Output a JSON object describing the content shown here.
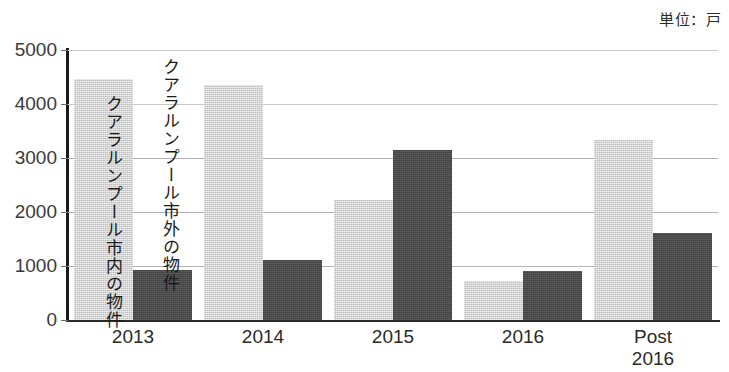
{
  "unit_caption": "単位：戸",
  "annotations": [
    {
      "id": "inside",
      "text": "クアラルンプール市内の物件"
    },
    {
      "id": "outside",
      "text": "クアラルンプール市外の物件"
    }
  ],
  "chart_data": {
    "type": "bar",
    "title": "",
    "subtitle": "",
    "xlabel": "",
    "ylabel": "",
    "unit": "単位：戸",
    "categories": [
      "2013",
      "2014",
      "2015",
      "2016",
      "Post\n2016"
    ],
    "series": [
      {
        "name": "クアラルンプール市内の物件",
        "color": "#bdbdbd",
        "values": [
          4460,
          4360,
          2230,
          720,
          3340
        ]
      },
      {
        "name": "クアラルンプール市外の物件",
        "color": "#4a4a4a",
        "values": [
          920,
          1120,
          3150,
          900,
          1620
        ]
      }
    ],
    "ylim": [
      0,
      5000
    ],
    "yticks": [
      0,
      1000,
      2000,
      3000,
      4000,
      5000
    ],
    "ytick_labels": [
      "0",
      "1000",
      "2000",
      "3000",
      "4000",
      "5000"
    ],
    "grid": true,
    "grid_axis": "y",
    "legend": "inline-vertical-annotations",
    "legend_position": "inside-plot-left"
  },
  "colors": {
    "bar_light": "#bdbdbd",
    "bar_dark": "#4a4a4a",
    "gridline": "#b3b3b3",
    "axis": "#1a1a1a",
    "text": "#2b2b2b",
    "background": "#ffffff"
  }
}
